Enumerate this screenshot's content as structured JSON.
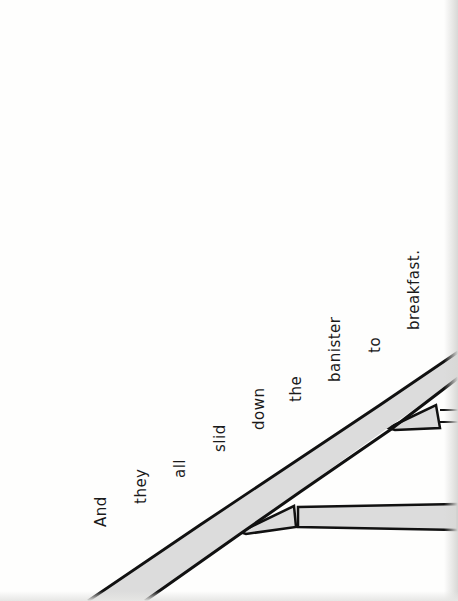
{
  "story": {
    "words": [
      {
        "text": "And",
        "x": 92,
        "y": 527
      },
      {
        "text": "they",
        "x": 132,
        "y": 504
      },
      {
        "text": "all",
        "x": 171,
        "y": 478
      },
      {
        "text": "slid",
        "x": 211,
        "y": 452
      },
      {
        "text": "down",
        "x": 250,
        "y": 430
      },
      {
        "text": "the",
        "x": 287,
        "y": 402
      },
      {
        "text": "banister",
        "x": 326,
        "y": 382
      },
      {
        "text": "to",
        "x": 366,
        "y": 353
      },
      {
        "text": "breakfast.",
        "x": 405,
        "y": 330
      }
    ]
  },
  "illustration": {
    "subject": "banister-with-posts",
    "rail_fill": "#dcdcdc",
    "outline": "#111111"
  }
}
